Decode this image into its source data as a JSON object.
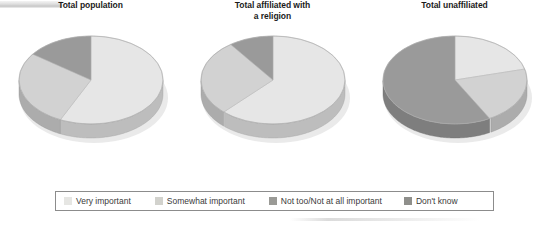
{
  "legend": {
    "items": [
      {
        "label": "Very important",
        "color": "#e6e6e3",
        "swatch_name": "legend-swatch-very-important"
      },
      {
        "label": "Somewhat important",
        "color": "#d2d2cd",
        "swatch_name": "legend-swatch-somewhat-important"
      },
      {
        "label": "Not too/Not at all important",
        "color": "#9a9a96",
        "swatch_name": "legend-swatch-not-too-important"
      },
      {
        "label": "Don't know",
        "color": "#8f8f8b",
        "swatch_name": "legend-swatch-dont-know"
      }
    ]
  },
  "charts": [
    {
      "title_line1": "Total population",
      "title_line2": ""
    },
    {
      "title_line1": "Total affiliated with",
      "title_line2": "a religion"
    },
    {
      "title_line1": "Total unaffiliated",
      "title_line2": ""
    }
  ],
  "chart_data": [
    {
      "type": "pie",
      "title": "Total population",
      "labels": [
        "Very important",
        "Somewhat important",
        "Not too/Not at all important",
        "Don't know"
      ],
      "values": [
        57,
        28,
        15,
        0
      ],
      "colors": [
        "#e6e6e3",
        "#d2d2cd",
        "#9a9a96",
        "#8f8f8b"
      ],
      "start_angle_deg": 0,
      "direction": "clockwise",
      "legend_position": "bottom",
      "grid": false
    },
    {
      "type": "pie",
      "title": "Total affiliated with a religion",
      "labels": [
        "Very important",
        "Somewhat important",
        "Not too/Not at all important",
        "Don't know"
      ],
      "values": [
        62,
        28,
        10,
        0
      ],
      "colors": [
        "#e6e6e3",
        "#d2d2cd",
        "#9a9a96",
        "#8f8f8b"
      ],
      "start_angle_deg": 0,
      "direction": "clockwise",
      "legend_position": "bottom",
      "grid": false
    },
    {
      "type": "pie",
      "title": "Total unaffiliated",
      "labels": [
        "Very important",
        "Somewhat important",
        "Not too/Not at all important",
        "Don't know"
      ],
      "values": [
        21,
        21,
        58,
        0
      ],
      "colors": [
        "#e6e6e3",
        "#d2d2cd",
        "#9a9a96",
        "#8f8f8b"
      ],
      "start_angle_deg": 0,
      "direction": "clockwise",
      "legend_position": "bottom",
      "grid": false
    }
  ]
}
